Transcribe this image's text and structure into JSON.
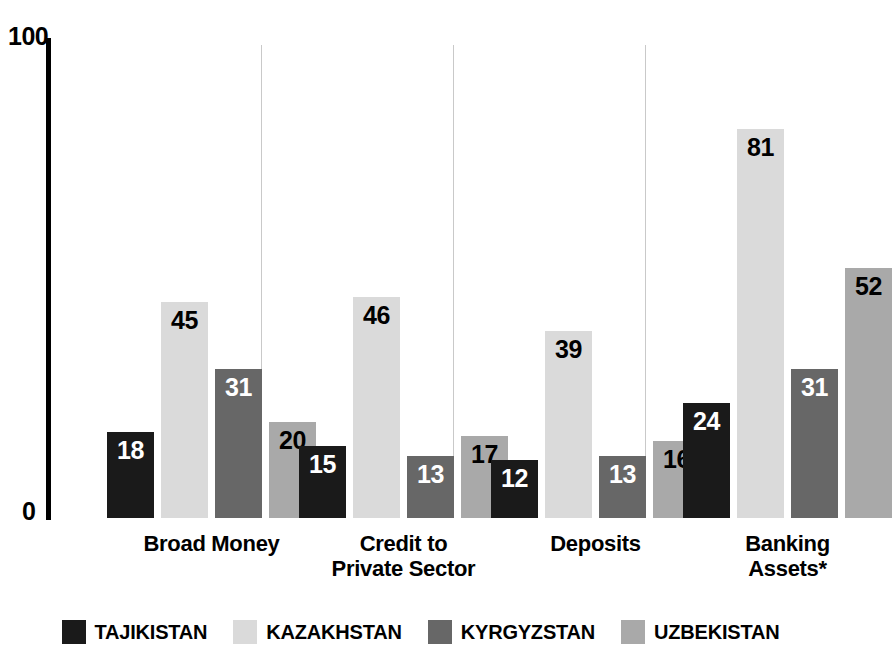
{
  "chart_data": {
    "type": "bar",
    "title": "",
    "xlabel": "",
    "ylabel": "",
    "ylim": [
      0,
      100
    ],
    "y_ticks": [
      "0",
      "100"
    ],
    "grid": false,
    "legend_position": "bottom",
    "categories": [
      "Broad Money",
      "Credit to Private Sector",
      "Deposits",
      "Banking Assets*"
    ],
    "category_lines": [
      [
        "Broad Money"
      ],
      [
        "Credit to",
        "Private Sector"
      ],
      [
        "Deposits"
      ],
      [
        "Banking",
        "Assets*"
      ]
    ],
    "series": [
      {
        "name": "TAJIKISTAN",
        "color": "#1a1a1a",
        "label_color": "#ffffff",
        "values": [
          18,
          15,
          12,
          24
        ]
      },
      {
        "name": "KAZAKHSTAN",
        "color": "#dadada",
        "label_color": "#000000",
        "values": [
          45,
          46,
          39,
          81
        ]
      },
      {
        "name": "KYRGYZSTAN",
        "color": "#676767",
        "label_color": "#ffffff",
        "values": [
          31,
          13,
          13,
          31
        ]
      },
      {
        "name": "UZBEKISTAN",
        "color": "#a9a9a9",
        "label_color": "#000000",
        "values": [
          20,
          17,
          16,
          52
        ]
      }
    ]
  },
  "axis": {
    "top_label": "100",
    "bottom_label": "0"
  },
  "legend": {
    "items": [
      {
        "label": "TAJIKISTAN",
        "color": "#1a1a1a"
      },
      {
        "label": "KAZAKHSTAN",
        "color": "#dadada"
      },
      {
        "label": "KYRGYZSTAN",
        "color": "#676767"
      },
      {
        "label": "UZBEKISTAN",
        "color": "#a9a9a9"
      }
    ]
  }
}
